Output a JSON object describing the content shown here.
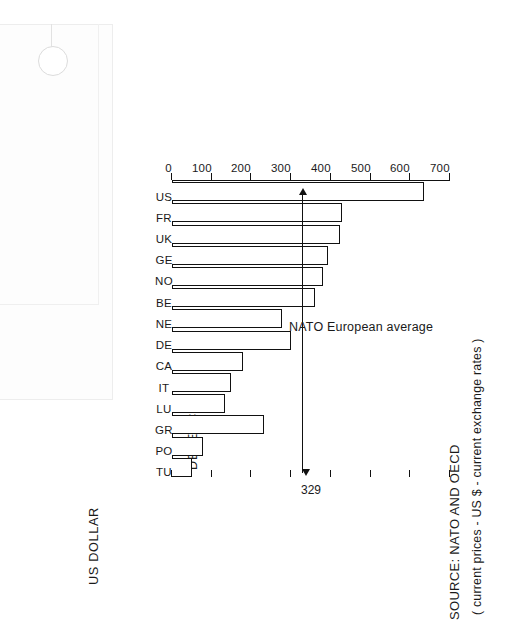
{
  "document": {
    "title": "DEFENCE",
    "axis_title": "US DOLLAR",
    "source": "SOURCE: NATO AND OECD",
    "units": "( current prices - US $ - current exchange rates )"
  },
  "annotation": {
    "caption": "NATO European average",
    "value": "329"
  },
  "chart_data": {
    "type": "bar",
    "orientation": "horizontal-printed-sideways",
    "title": "DEFENCE",
    "xlabel": "",
    "ylabel": "US DOLLAR",
    "subtitle": "( current prices - US $ - current exchange rates )",
    "source": "SOURCE: NATO AND OECD",
    "categories": [
      "US",
      "FR",
      "UK",
      "GE",
      "NO",
      "BE",
      "NE",
      "DE",
      "CA",
      "IT",
      "LU",
      "GR",
      "PO",
      "TU"
    ],
    "values": [
      632,
      425,
      420,
      390,
      378,
      357,
      275,
      297,
      177,
      146,
      132,
      229,
      75,
      47
    ],
    "ylim": [
      0,
      700
    ],
    "yticks": [
      700,
      600,
      500,
      400,
      300,
      200,
      100,
      0
    ],
    "ytick_labels": [
      "700",
      "600",
      "500",
      "400",
      "300",
      "200",
      "100",
      "0"
    ],
    "grid": false,
    "legend": null,
    "annotations": [
      {
        "label": "NATO European average",
        "value": 329,
        "type": "reference-line-with-arrows"
      }
    ]
  },
  "bars": [
    {
      "code": "US",
      "value": 632
    },
    {
      "code": "FR",
      "value": 425
    },
    {
      "code": "UK",
      "value": 420
    },
    {
      "code": "GE",
      "value": 390
    },
    {
      "code": "NO",
      "value": 378
    },
    {
      "code": "BE",
      "value": 357
    },
    {
      "code": "NE",
      "value": 275
    },
    {
      "code": "DE",
      "value": 297
    },
    {
      "code": "CA",
      "value": 177
    },
    {
      "code": "IT",
      "value": 146
    },
    {
      "code": "LU",
      "value": 132
    },
    {
      "code": "GR",
      "value": 229
    },
    {
      "code": "PO",
      "value": 75
    },
    {
      "code": "TU",
      "value": 47
    }
  ],
  "ticks": [
    {
      "label": "700",
      "value": 700
    },
    {
      "label": "600",
      "value": 600
    },
    {
      "label": "500",
      "value": 500
    },
    {
      "label": "400",
      "value": 400
    },
    {
      "label": "300",
      "value": 300
    },
    {
      "label": "200",
      "value": 200
    },
    {
      "label": "100",
      "value": 100
    },
    {
      "label": "0",
      "value": 0
    }
  ],
  "colors": {
    "ink": "#111111",
    "paper": "#ffffff"
  }
}
